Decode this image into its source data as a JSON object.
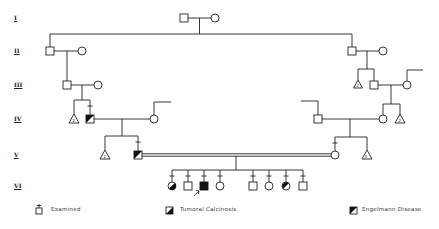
{
  "generations": [
    "I",
    "II",
    "III",
    "IV",
    "V",
    "VI"
  ],
  "legend": {
    "examined": "Examined",
    "tumoral_calcinosis": "Tumoral Calcinosis",
    "engelmann_disease": "Engelmann Disease"
  },
  "colors": {
    "line": "#222222",
    "fill": "#111111",
    "background": "#ffffff"
  }
}
